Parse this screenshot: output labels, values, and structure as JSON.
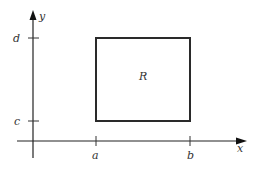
{
  "diagram": {
    "type": "coordinate-region",
    "axes": {
      "x_label": "x",
      "y_label": "y"
    },
    "ticks": {
      "x": [
        {
          "label": "a",
          "pos": 96
        },
        {
          "label": "b",
          "pos": 190
        }
      ],
      "y": [
        {
          "label": "c",
          "pos": 121
        },
        {
          "label": "d",
          "pos": 38
        }
      ]
    },
    "region": {
      "label": "R",
      "description": "Rectangle bounded by x=a, x=b, y=c, y=d"
    },
    "colors": {
      "stroke": "#222222",
      "label": "#333333",
      "background": "#ffffff"
    }
  }
}
